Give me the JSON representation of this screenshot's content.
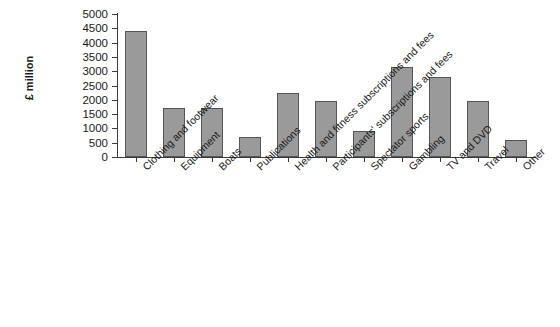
{
  "chart_data": {
    "type": "bar",
    "title": "",
    "xlabel": "",
    "ylabel": "£ million",
    "ylim": [
      0,
      5000
    ],
    "ytick_labels": [
      "0",
      "500",
      "1000",
      "1500",
      "2000",
      "2500",
      "3000",
      "3500",
      "4000",
      "4500",
      "5000"
    ],
    "ytick_values": [
      0,
      500,
      1000,
      1500,
      2000,
      2500,
      3000,
      3500,
      4000,
      4500,
      5000
    ],
    "grid": false,
    "legend": "none",
    "bar_color": "#9a9a9a",
    "bar_edge_color": "#555555",
    "axis_color": "#3b3b3b",
    "categories": [
      "Clothing and footwear",
      "Equipment",
      "Boats",
      "Publications",
      "Health and fitness subscriptions and fees",
      "Participants' subscriptions and fees",
      "Spectator sports",
      "Gambling",
      "TV and DVD",
      "Travel",
      "Other"
    ],
    "values": [
      4400,
      1700,
      1700,
      700,
      2250,
      1950,
      900,
      3150,
      2800,
      1950,
      600
    ]
  }
}
